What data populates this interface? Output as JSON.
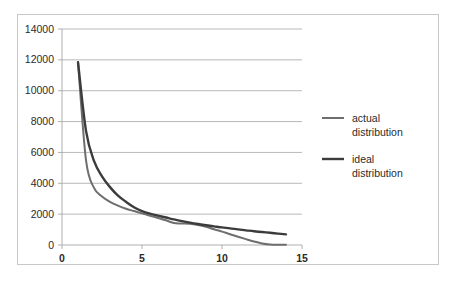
{
  "chart_data": {
    "type": "line",
    "title": "",
    "xlabel": "",
    "ylabel": "",
    "xlim": [
      0,
      15
    ],
    "ylim": [
      0,
      14000
    ],
    "grid": true,
    "legend_position": "right",
    "x_ticks": [
      "0",
      "5",
      "10",
      "15"
    ],
    "x_tick_values": [
      0,
      5,
      10,
      15
    ],
    "y_ticks": [
      "0",
      "2000",
      "4000",
      "6000",
      "8000",
      "10000",
      "12000",
      "14000"
    ],
    "y_tick_values": [
      0,
      2000,
      4000,
      6000,
      8000,
      10000,
      12000,
      14000
    ],
    "series": [
      {
        "name": "actual distribution",
        "color": "#6e6e6e",
        "width": 2.0,
        "x": [
          1,
          1.5,
          2,
          2.5,
          3,
          3.5,
          4,
          4.5,
          5,
          5.5,
          6,
          6.5,
          7,
          7.5,
          8,
          8.5,
          9,
          9.5,
          10,
          10.5,
          11,
          11.5,
          12,
          12.5,
          13,
          13.5,
          14
        ],
        "values": [
          11850,
          5500,
          3700,
          3150,
          2800,
          2550,
          2350,
          2200,
          2050,
          1900,
          1750,
          1600,
          1420,
          1400,
          1380,
          1300,
          1180,
          1020,
          870,
          700,
          540,
          380,
          230,
          100,
          30,
          10,
          10
        ]
      },
      {
        "name": "ideal distribution",
        "color": "#3c3c3c",
        "width": 2.4,
        "x": [
          1,
          1.5,
          2,
          2.5,
          3,
          3.5,
          4,
          4.5,
          5,
          5.5,
          6,
          6.5,
          7,
          7.5,
          8,
          8.5,
          9,
          9.5,
          10,
          10.5,
          11,
          11.5,
          12,
          12.5,
          13,
          13.5,
          14
        ],
        "values": [
          11850,
          7400,
          5450,
          4450,
          3750,
          3200,
          2800,
          2450,
          2200,
          2030,
          1900,
          1780,
          1660,
          1550,
          1450,
          1360,
          1280,
          1210,
          1140,
          1080,
          1010,
          950,
          890,
          840,
          790,
          740,
          690
        ]
      }
    ]
  },
  "legend": {
    "entries": [
      {
        "line1": "actual",
        "line2": "distribution"
      },
      {
        "line1": "ideal",
        "line2": "distribution"
      }
    ]
  },
  "colors": {
    "grid": "#a6a6a6",
    "border": "#c8c8c8",
    "text": "#2b2b2b",
    "plot_background": "#ffffff"
  }
}
